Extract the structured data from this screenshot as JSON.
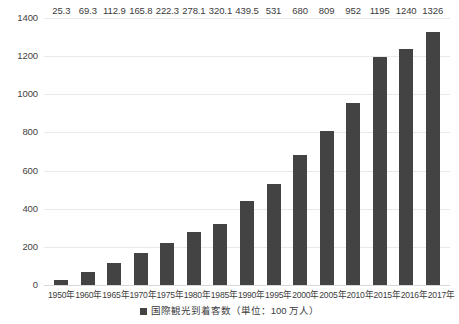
{
  "chart_data": {
    "type": "bar",
    "title": "",
    "subtitle": "",
    "xlabel": "",
    "ylabel": "",
    "categories": [
      "1950年",
      "1960年",
      "1965年",
      "1970年",
      "1975年",
      "1980年",
      "1985年",
      "1990年",
      "1995年",
      "2000年",
      "2005年",
      "2010年",
      "2015年",
      "2016年",
      "2017年"
    ],
    "values": [
      25.3,
      69.3,
      112.9,
      165.8,
      222.3,
      278.1,
      320.1,
      439.5,
      531,
      680,
      809,
      952,
      1195,
      1240,
      1326
    ],
    "value_labels": [
      "25.3",
      "69.3",
      "112.9",
      "165.8",
      "222.3",
      "278.1",
      "320.1",
      "439.5",
      "531",
      "680",
      "809",
      "952",
      "1195",
      "1240",
      "1326"
    ],
    "series": [
      {
        "name": "国際観光到着客数（単位：100 万人）",
        "values": [
          25.3,
          69.3,
          112.9,
          165.8,
          222.3,
          278.1,
          320.1,
          439.5,
          531,
          680,
          809,
          952,
          1195,
          1240,
          1326
        ]
      }
    ],
    "ylim": [
      0,
      1400
    ],
    "ytick_values": [
      0,
      200,
      400,
      600,
      800,
      1000,
      1200,
      1400
    ],
    "ytick_labels": [
      "0",
      "200",
      "400",
      "600",
      "800",
      "1000",
      "1200",
      "1400"
    ],
    "grid": true,
    "grid_axis": "y",
    "legend_position": "bottom",
    "legend": [
      "国際観光到着客数（単位：100 万人）"
    ],
    "colors": {
      "bar": "#434343",
      "background": "#ffffff",
      "gridline": "#e9e9e9",
      "axis_text": "#3b3b3b"
    }
  },
  "legend": {
    "marker_name": "legend-swatch-square",
    "label": "国際観光到着客数（単位：100 万人）"
  }
}
